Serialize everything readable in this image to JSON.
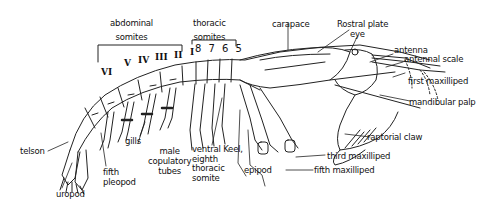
{
  "diagram": {
    "group_labels": {
      "abdominal": "abdominal somites",
      "abdominal_line1": "abdominal",
      "abdominal_line2": "somites",
      "thoracic_line1": "thoracic",
      "thoracic_line2": "somites"
    },
    "abdominal_numerals": [
      "VI",
      "V",
      "IV",
      "III",
      "II",
      "I"
    ],
    "thoracic_numerals": "8 7 6 5",
    "labels": {
      "carapace": "carapace",
      "rostral_plate": "Rostral plate",
      "eye": "eye",
      "antenna": "antenna",
      "antennal_scale": "antennal scale",
      "first_maxilliped": "first maxilliped",
      "mandibular_palp": "mandibular palp",
      "raptorial_claw": "raptorial claw",
      "third_maxilliped": "third maxilliped",
      "fifth_maxilliped": "fifth maxilliped",
      "epipod": "epipod",
      "ventral_keel_1": "ventral Keel,",
      "ventral_keel_2": "eighth",
      "ventral_keel_3": "thoracic",
      "ventral_keel_4": "somite",
      "male_tubes_1": "male",
      "male_tubes_2": "copulatory",
      "male_tubes_3": "tubes",
      "gills": "gills",
      "fifth_pleopod_1": "fifth",
      "fifth_pleopod_2": "pleopod",
      "telson": "telson",
      "uropod": "uropod"
    }
  }
}
